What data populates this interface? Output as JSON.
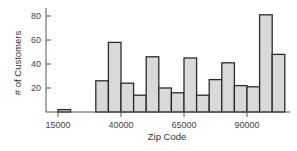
{
  "chart_data": {
    "type": "bar",
    "subtype": "histogram",
    "title": "",
    "xlabel": "Zip Code",
    "ylabel": "# of Customers",
    "bin_width": 5000,
    "bins": [
      {
        "start": 15000,
        "end": 20000,
        "count": 2
      },
      {
        "start": 20000,
        "end": 25000,
        "count": 0
      },
      {
        "start": 25000,
        "end": 30000,
        "count": 0
      },
      {
        "start": 30000,
        "end": 35000,
        "count": 26
      },
      {
        "start": 35000,
        "end": 40000,
        "count": 58
      },
      {
        "start": 40000,
        "end": 45000,
        "count": 24
      },
      {
        "start": 45000,
        "end": 50000,
        "count": 14
      },
      {
        "start": 50000,
        "end": 55000,
        "count": 46
      },
      {
        "start": 55000,
        "end": 60000,
        "count": 20
      },
      {
        "start": 60000,
        "end": 65000,
        "count": 16
      },
      {
        "start": 65000,
        "end": 70000,
        "count": 45
      },
      {
        "start": 70000,
        "end": 75000,
        "count": 14
      },
      {
        "start": 75000,
        "end": 80000,
        "count": 27
      },
      {
        "start": 80000,
        "end": 85000,
        "count": 41
      },
      {
        "start": 85000,
        "end": 90000,
        "count": 22
      },
      {
        "start": 90000,
        "end": 95000,
        "count": 21
      },
      {
        "start": 95000,
        "end": 100000,
        "count": 81
      },
      {
        "start": 100000,
        "end": 105000,
        "count": 48
      }
    ],
    "x_ticks": [
      15000,
      40000,
      65000,
      90000
    ],
    "x_tick_labels": [
      "15000",
      "40000",
      "65000",
      "90000"
    ],
    "y_ticks": [
      20,
      40,
      60,
      80
    ],
    "y_tick_labels": [
      "20",
      "40",
      "60",
      "80"
    ],
    "xlim": [
      10000,
      110000
    ],
    "ylim": [
      0,
      85
    ],
    "grid": false,
    "legend": null,
    "colors": {
      "bar_fill": "#d9d9d9",
      "bar_stroke": "#2b2b2b",
      "axis": "#555555"
    }
  }
}
